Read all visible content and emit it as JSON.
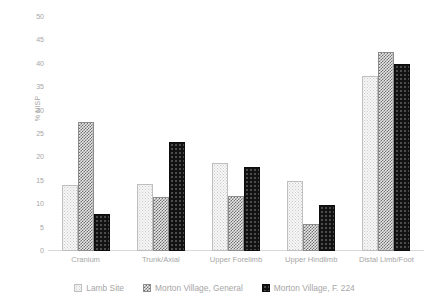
{
  "chart_data": {
    "type": "bar",
    "title": "",
    "xlabel": "",
    "ylabel": "% NISP",
    "ylim": [
      0,
      50
    ],
    "yticks": [
      50,
      45,
      40,
      35,
      30,
      25,
      20,
      15,
      10,
      5,
      0
    ],
    "grid": false,
    "legend_position": "bottom",
    "categories": [
      "Cranium",
      "Trunk/Axial",
      "Upper Forelimb",
      "Upper Hindlimb",
      "Distal Limb/Foot"
    ],
    "series": [
      {
        "name": "Lamb Site",
        "pattern": "light-dotted",
        "color": "#f7f7f7",
        "values": [
          14.1,
          14.4,
          18.8,
          14.9,
          37.5
        ]
      },
      {
        "name": "Morton Village, General",
        "pattern": "gray-checkerboard",
        "color": "#6e6e6e",
        "values": [
          27.6,
          11.6,
          11.8,
          5.8,
          42.5
        ]
      },
      {
        "name": "Morton Village, F. 224",
        "pattern": "black-speckled",
        "color": "#121212",
        "values": [
          7.9,
          23.2,
          17.9,
          9.9,
          39.9
        ]
      }
    ]
  },
  "axis": {
    "y_title": "% NISP"
  }
}
